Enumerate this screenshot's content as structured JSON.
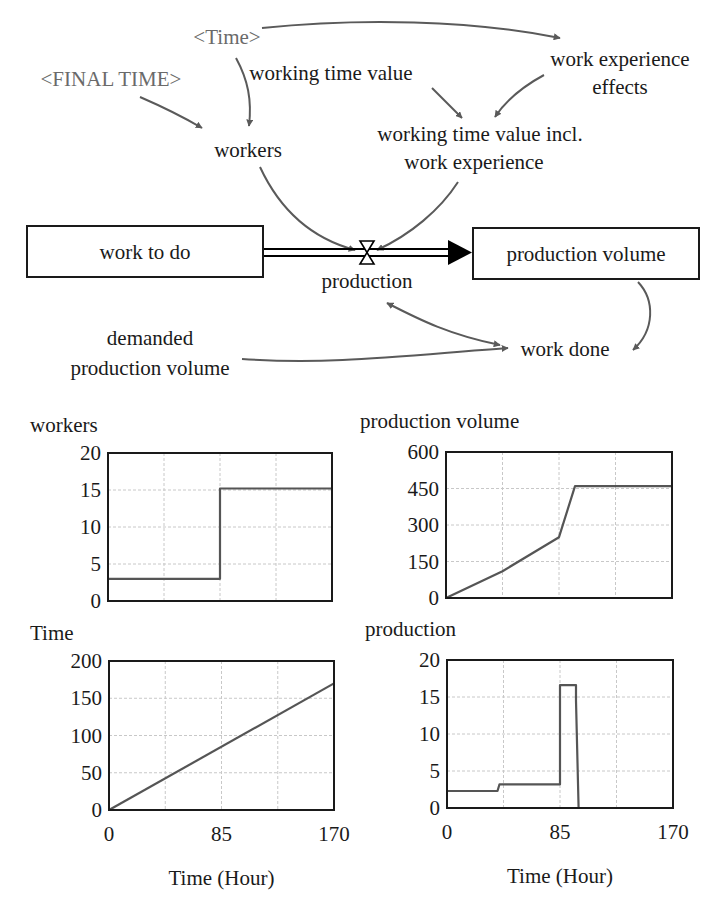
{
  "diagram": {
    "stocks": [
      {
        "id": "work_to_do",
        "label": "work to do",
        "x": 27,
        "y": 226,
        "w": 236,
        "h": 51
      },
      {
        "id": "production_volume",
        "label": "production volume",
        "x": 473,
        "y": 228,
        "w": 226,
        "h": 51
      }
    ],
    "flow": {
      "label": "production",
      "valve_x": 367,
      "valve_y": 252
    },
    "variables": [
      {
        "id": "time_shadow",
        "label": "<Time>",
        "shadow": true
      },
      {
        "id": "final_time_shadow",
        "label": "<FINAL TIME>",
        "shadow": true
      },
      {
        "id": "working_time_value",
        "label": "working time value",
        "shadow": false
      },
      {
        "id": "work_experience_effects_1",
        "label": "work experience",
        "shadow": false
      },
      {
        "id": "work_experience_effects_2",
        "label": "effects",
        "shadow": false
      },
      {
        "id": "workers",
        "label": "workers",
        "shadow": false
      },
      {
        "id": "wtv_incl_1",
        "label": "working time value incl.",
        "shadow": false
      },
      {
        "id": "wtv_incl_2",
        "label": "work experience",
        "shadow": false
      },
      {
        "id": "demanded_1",
        "label": "demanded",
        "shadow": false
      },
      {
        "id": "demanded_2",
        "label": "production volume",
        "shadow": false
      },
      {
        "id": "work_done",
        "label": "work done",
        "shadow": false
      }
    ],
    "colors": {
      "link": "#5a5a5a",
      "shadow_text": "#6a6a6a",
      "text": "#1a1a1a"
    }
  },
  "chart_data": [
    {
      "type": "line",
      "title": "workers",
      "xlabel": "",
      "ylabel": "",
      "xlim": [
        0,
        170
      ],
      "ylim": [
        0,
        20
      ],
      "yticks": [
        "0",
        "5",
        "10",
        "15",
        "20"
      ],
      "xticks": [],
      "grid": true,
      "series": [
        {
          "name": "workers",
          "x": [
            0,
            85,
            85,
            170
          ],
          "y": [
            3,
            3,
            15.2,
            15.2
          ]
        }
      ]
    },
    {
      "type": "line",
      "title": "production volume",
      "xlabel": "",
      "ylabel": "",
      "xlim": [
        0,
        170
      ],
      "ylim": [
        0,
        600
      ],
      "yticks": [
        "0",
        "150",
        "300",
        "450",
        "600"
      ],
      "xticks": [],
      "grid": true,
      "series": [
        {
          "name": "production volume",
          "x": [
            0,
            42.5,
            85,
            97,
            170
          ],
          "y": [
            0,
            110,
            250,
            460,
            460
          ]
        }
      ]
    },
    {
      "type": "line",
      "title": "Time",
      "xlabel": "Time (Hour)",
      "ylabel": "",
      "xlim": [
        0,
        170
      ],
      "ylim": [
        0,
        200
      ],
      "yticks": [
        "0",
        "50",
        "100",
        "150",
        "200"
      ],
      "xticks": [
        "0",
        "85",
        "170"
      ],
      "grid": true,
      "series": [
        {
          "name": "Time",
          "x": [
            0,
            170
          ],
          "y": [
            0,
            170
          ]
        }
      ]
    },
    {
      "type": "line",
      "title": "production",
      "xlabel": "Time (Hour)",
      "ylabel": "",
      "xlim": [
        0,
        170
      ],
      "ylim": [
        0,
        20
      ],
      "yticks": [
        "0",
        "5",
        "10",
        "15",
        "20"
      ],
      "xticks": [
        "0",
        "85",
        "170"
      ],
      "grid": true,
      "series": [
        {
          "name": "production",
          "x": [
            0,
            38,
            39.5,
            85,
            85,
            97,
            97,
            99,
            170
          ],
          "y": [
            2.3,
            2.3,
            3.2,
            3.2,
            16.6,
            16.6,
            14.5,
            0,
            0
          ]
        }
      ]
    }
  ]
}
